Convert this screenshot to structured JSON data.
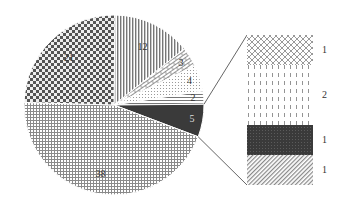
{
  "chart_data": {
    "type": "pie",
    "subtype": "pie-of-bar",
    "title": "",
    "main_pie": {
      "slices": [
        {
          "label": "12",
          "value": 12,
          "pattern": "vertical-lines"
        },
        {
          "label": "3",
          "value": 3,
          "pattern": "brick"
        },
        {
          "label": "4",
          "value": 4,
          "pattern": "dots"
        },
        {
          "label": "2",
          "value": 2,
          "pattern": "horizontal-lines"
        },
        {
          "label": "5",
          "value": 5,
          "pattern": "dark-solid",
          "exploded_to_bar": true
        },
        {
          "label": "38",
          "value": 38,
          "pattern": "grid"
        },
        {
          "label": "21",
          "value": 21,
          "pattern": "checker"
        }
      ]
    },
    "secondary_bar": {
      "segments": [
        {
          "label": "1",
          "value": 1,
          "pattern": "diamond-crosshatch"
        },
        {
          "label": "2",
          "value": 2,
          "pattern": "dashed-vertical"
        },
        {
          "label": "1",
          "value": 1,
          "pattern": "dark-dotted"
        },
        {
          "label": "1",
          "value": 1,
          "pattern": "diagonal-lines"
        }
      ]
    },
    "legend": "none",
    "grid": false
  }
}
